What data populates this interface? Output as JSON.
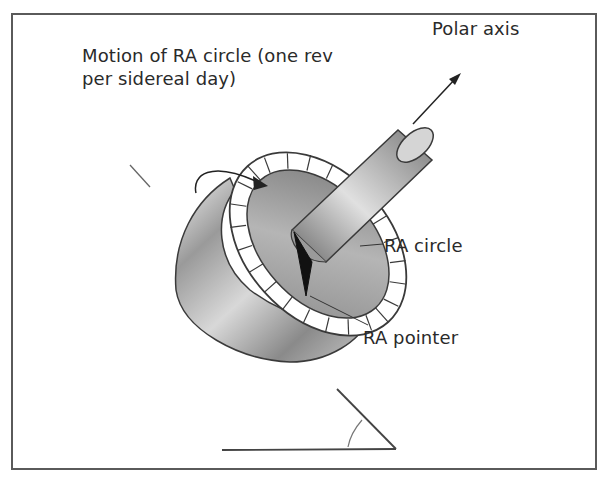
{
  "figure": {
    "labels": {
      "motion_line1": "Motion of RA circle (one rev",
      "motion_line2": "per sidereal day)",
      "polar_axis": "Polar axis",
      "ra_circle": "RA circle",
      "ra_pointer": "RA pointer"
    },
    "components": [
      "polar-axis-shaft",
      "ra-setting-circle",
      "ra-pointer",
      "mount-cylinder",
      "rotation-arrow",
      "latitude-angle-indicator"
    ],
    "colors": {
      "frame": "#5a5a5a",
      "text": "#2a2a2a",
      "pointer": "#111111"
    }
  }
}
